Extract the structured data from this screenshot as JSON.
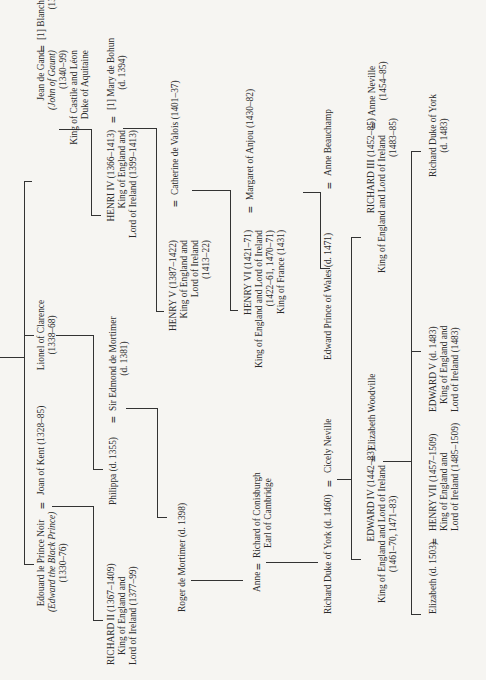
{
  "chart": {
    "orientation": "rotated 90 degrees counterclockwise",
    "people": {
      "edward_black_prince": {
        "name": "Edouard le Prince Noir",
        "alt": "(Edward the Black Prince)",
        "dates": "(1330–76)"
      },
      "joan_of_kent": {
        "name": "Joan of Kent (1328–85)"
      },
      "lionel": {
        "name": "Lionel of Clarence",
        "dates": "(1338–68)"
      },
      "jean_de_gand": {
        "name": "Jean de Gand",
        "alt": "(John of Gaunt)",
        "dates": "(1340–99)",
        "title1": "King of Castile and Léon",
        "title2": "Duke of Aquitaine"
      },
      "blanche": {
        "name": "[1] Blanche of Lancaster",
        "dates": "(1345–69)"
      },
      "richard_ii": {
        "name": "RICHARD II (1367–1409)",
        "title1": "King of England and",
        "title2": "Lord of Ireland (1377–99)"
      },
      "philippa": {
        "name": "Philippa (d. 1355)"
      },
      "edmond_mortimer": {
        "name": "Sir Edmond de Mortimer",
        "dates": "(d. 1381)"
      },
      "henri_iv": {
        "name": "HENRI IV (1366–1413)",
        "title1": "King of England and",
        "title2": "Lord of Ireland (1399–1413)"
      },
      "mary_bohun": {
        "name": "[1] Mary de Bohun",
        "dates": "(d. 1394)"
      },
      "roger_mortimer": {
        "name": "Roger de Mortimer (d. 1398)"
      },
      "henry_v": {
        "name": "HENRY V (1387–1422)",
        "title1": "King of England and",
        "title2": "Lord of Ireland",
        "dates": "(1413–22)"
      },
      "catherine": {
        "name": "Catherine de Valois (1401–37)"
      },
      "anne": {
        "name": "Anne"
      },
      "richard_conisburgh": {
        "name": "Richard of Conisburgh",
        "title1": "Earl of Cambridge"
      },
      "henry_vi": {
        "name": "HENRY VI (1421–71)",
        "title1": "King of England and Lord of Ireland",
        "dates": "(1422–61, 1470–71)",
        "title2": "King of France (1431)"
      },
      "margaret": {
        "name": "Margaret of Anjou (1430–82)"
      },
      "richard_york": {
        "name": "Richard Duke of York (d. 1460)"
      },
      "cicely": {
        "name": "Cicely Neville"
      },
      "edward_prince_wales": {
        "name": "Edward Prince of Wales (d. 1471)"
      },
      "anne_beauchamp": {
        "name": "Anne Beauchamp"
      },
      "edward_iv": {
        "name": "EDWARD IV (1442–83)",
        "title1": "King of England and Lord of Ireland",
        "dates": "(1461–70, 1471–83)"
      },
      "elizabeth_woodville": {
        "name": "Elizabeth Woodville"
      },
      "richard_iii": {
        "name": "RICHARD III (1452–85)",
        "title1": "King of England and Lord of Ireland",
        "dates": "(1483–85)"
      },
      "anne_neville": {
        "name": "Anne Neville",
        "dates": "(1454–85)"
      },
      "elizabeth_york": {
        "name": "Elizabeth (d. 1503)"
      },
      "henry_vii": {
        "name": "HENRY VII (1457–1509)",
        "title1": "King of England and",
        "title2": "Lord of Ireland (1485–1509)"
      },
      "edward_v": {
        "name": "EDWARD V (d. 1483)",
        "title1": "King of England and",
        "title2": "Lord of Ireland (1483)"
      },
      "richard_duke_york_1483": {
        "name": "Richard Duke of York",
        "dates": "(d. 1483)"
      }
    },
    "marriage_symbol": "="
  }
}
